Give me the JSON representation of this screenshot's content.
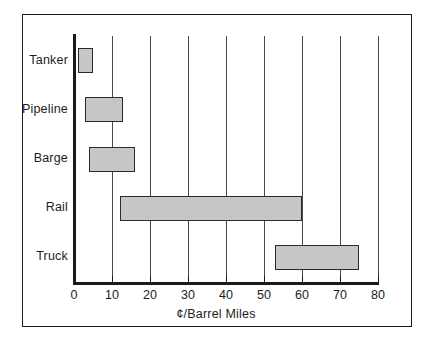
{
  "chart_data": {
    "type": "bar",
    "orientation": "horizontal",
    "style": "range-bar",
    "title": "",
    "xlabel": "¢/Barrel Miles",
    "ylabel": "",
    "xlim": [
      0,
      80
    ],
    "xticks": [
      0,
      10,
      20,
      30,
      40,
      50,
      60,
      70,
      80
    ],
    "xtick_labels": [
      "0",
      "10",
      "20",
      "30",
      "40",
      "50",
      "60",
      "70",
      "80"
    ],
    "grid": "vertical",
    "legend": "none",
    "categories": [
      "Tanker",
      "Pipeline",
      "Barge",
      "Rail",
      "Truck"
    ],
    "ranges": [
      {
        "category": "Tanker",
        "start": 1,
        "end": 5
      },
      {
        "category": "Pipeline",
        "start": 3,
        "end": 13
      },
      {
        "category": "Barge",
        "start": 4,
        "end": 16
      },
      {
        "category": "Rail",
        "start": 12,
        "end": 60
      },
      {
        "category": "Truck",
        "start": 53,
        "end": 75
      }
    ],
    "colors": {
      "bar_fill": "#c6c6c6",
      "bar_border": "#2b2b2b",
      "axis": "#1a1a1a",
      "gridline": "#4a4a4a",
      "background": "#ffffff",
      "frame": "#1a1a1a"
    }
  }
}
